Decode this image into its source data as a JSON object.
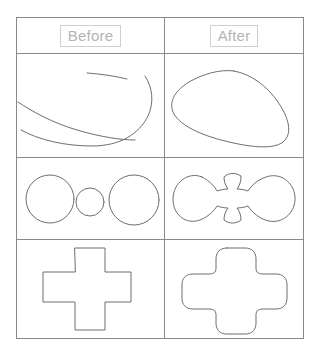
{
  "figure": {
    "kind": "before-after-comparison-table",
    "columns": [
      {
        "key": "before",
        "label": "Before"
      },
      {
        "key": "after",
        "label": "After"
      }
    ],
    "rows": [
      {
        "key": "freeform-stroke",
        "before": {
          "name": "open-sketch-strokes",
          "caption": ""
        },
        "after": {
          "name": "closed-rounded-blob",
          "caption": ""
        }
      },
      {
        "key": "circle-chain",
        "before": {
          "name": "three-separate-circles",
          "caption": ""
        },
        "after": {
          "name": "three-merged-circles-with-fillets",
          "caption": ""
        }
      },
      {
        "key": "cross",
        "before": {
          "name": "sharp-corner-cross",
          "caption": ""
        },
        "after": {
          "name": "rounded-corner-cross",
          "caption": ""
        }
      }
    ],
    "colors": {
      "background": "#ffffff",
      "grid_line": "#8a8a8a",
      "stroke": "#6e6e73",
      "label_text": "#b4b4b4",
      "label_border": "#cfcfcf"
    }
  }
}
